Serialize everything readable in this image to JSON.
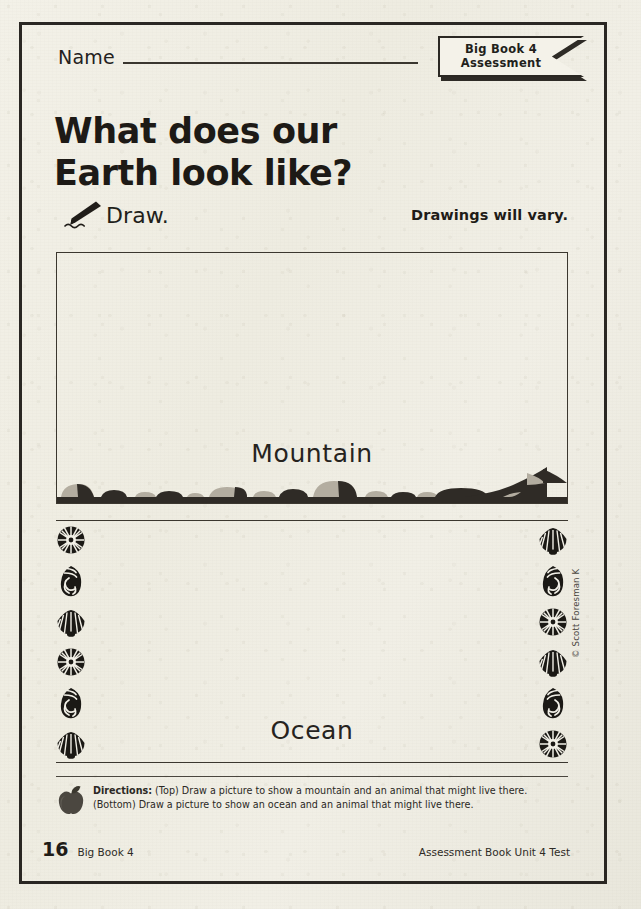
{
  "worksheet": {
    "name_label": "Name",
    "ribbon": {
      "line1": "Big Book 4",
      "line2": "Assessment"
    },
    "title": {
      "line1": "What does our",
      "line2": "Earth look like?"
    },
    "draw_row": {
      "icon": "pencil-icon",
      "label": "Draw.",
      "answer_note": "Drawings will vary."
    },
    "mountain_box": {
      "label": "Mountain",
      "decoration": "rock-border-icon"
    },
    "ocean_box": {
      "label": "Ocean",
      "decoration": "shell-border-icon",
      "left_shells": [
        "spiral-shell-icon",
        "conch-shell-icon",
        "scallop-shell-icon",
        "spiral-shell-icon",
        "conch-shell-icon",
        "scallop-shell-icon"
      ],
      "right_shells": [
        "scallop-shell-icon",
        "conch-shell-icon",
        "spiral-shell-icon",
        "scallop-shell-icon",
        "conch-shell-icon",
        "spiral-shell-icon"
      ]
    },
    "copyright": "© Scott Foresman K",
    "directions": {
      "icon": "apple-icon",
      "label": "Directions:",
      "body": " (Top) Draw a picture to show a mountain and an animal that might live there. (Bottom) Draw a picture to show an ocean and an animal that might live there."
    },
    "footer": {
      "page_number": "16",
      "left_label": "Big Book 4",
      "right_label": "Assessment Book Unit 4 Test"
    }
  },
  "colors": {
    "ink": "#1d1a16",
    "rule": "#3b372f",
    "paper": "#f1efe6",
    "rock_light": "#b3ada0",
    "rock_dark": "#2f2b26"
  }
}
